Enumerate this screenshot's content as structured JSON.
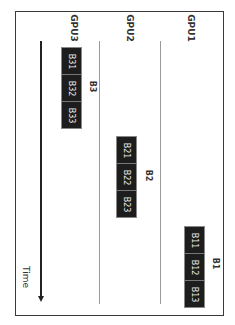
{
  "diagram": {
    "orientation": "rotated-90-clockwise",
    "lanes": [
      {
        "label": "GPU3"
      },
      {
        "label": "GPU2"
      },
      {
        "label": "GPU1"
      }
    ],
    "time_axis": {
      "label": "Time"
    },
    "groups": [
      {
        "label": "B3",
        "lane": "GPU3",
        "batches": [
          "B31",
          "B32",
          "B33"
        ]
      },
      {
        "label": "B2",
        "lane": "GPU2",
        "batches": [
          "B21",
          "B22",
          "B23"
        ]
      },
      {
        "label": "B1",
        "lane": "GPU1",
        "batches": [
          "B11",
          "B12",
          "B13"
        ]
      }
    ],
    "colors": {
      "block_fill": "#1d1d1d",
      "block_text": "#e8e8e8",
      "frame": "#3a3a3a",
      "lane_line": "#9a9a9a"
    }
  }
}
